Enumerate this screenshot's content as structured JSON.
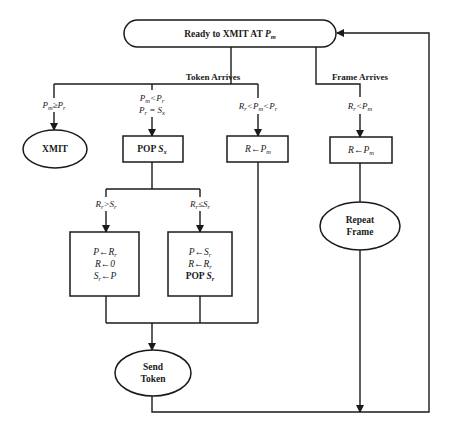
{
  "diagram": {
    "type": "flowchart",
    "start": {
      "text": "Ready to XMIT AT ",
      "var": "P",
      "sub": "m"
    },
    "branches": {
      "token": {
        "label": "Token Arrives"
      },
      "frame": {
        "label": "Frame Arrives"
      }
    },
    "conditions": {
      "c1": {
        "a": "P",
        "a_sub": "m",
        "op": "≥",
        "b": "P",
        "b_sub": "r"
      },
      "c2_line1": {
        "a": "P",
        "a_sub": "m",
        "op": "<",
        "b": "P",
        "b_sub": "r"
      },
      "c2_line2": {
        "a": "P",
        "a_sub": "r",
        "op": " = ",
        "b": "S",
        "b_sub": "x"
      },
      "c3": {
        "a": "R",
        "a_sub": "r",
        "op1": "<",
        "b": "P",
        "b_sub": "m",
        "op2": "<",
        "c": "P",
        "c_sub": "r"
      },
      "c4": {
        "a": "R",
        "a_sub": "r",
        "op": "<",
        "b": "P",
        "b_sub": "m"
      },
      "c5": {
        "a": "R",
        "a_sub": "r",
        "op": ">",
        "b": "S",
        "b_sub": "r"
      },
      "c6": {
        "a": "R",
        "a_sub": "r",
        "op": "≤",
        "b": "S",
        "b_sub": "r"
      }
    },
    "nodes": {
      "xmit": {
        "text": "XMIT"
      },
      "pop_sx": {
        "text": "POP ",
        "var": "S",
        "sub": "x"
      },
      "r_pm_1": {
        "lhs": "R",
        "arrow": "←",
        "var": "P",
        "sub": "m"
      },
      "r_pm_2": {
        "lhs": "R",
        "arrow": "←",
        "var": "P",
        "sub": "m"
      },
      "left_box": {
        "line1": {
          "lhs": "P",
          "arrow": "←",
          "var": "R",
          "sub": "r"
        },
        "line2": {
          "lhs": "R",
          "arrow": "←",
          "var": "0"
        },
        "line3": {
          "lhs": "S",
          "lhs_sub": "r",
          "arrow": "←",
          "var": "P"
        }
      },
      "mid_box": {
        "line1": {
          "lhs": "P",
          "arrow": "←",
          "var": "S",
          "sub": "r"
        },
        "line2": {
          "lhs": "R",
          "arrow": "←",
          "var": "R",
          "sub": "r"
        },
        "line3": {
          "text": "POP ",
          "var": "S",
          "sub": "r"
        }
      },
      "repeat_frame": {
        "line1": "Repeat",
        "line2": "Frame"
      },
      "send_token": {
        "line1": "Send",
        "line2": "Token"
      }
    }
  }
}
